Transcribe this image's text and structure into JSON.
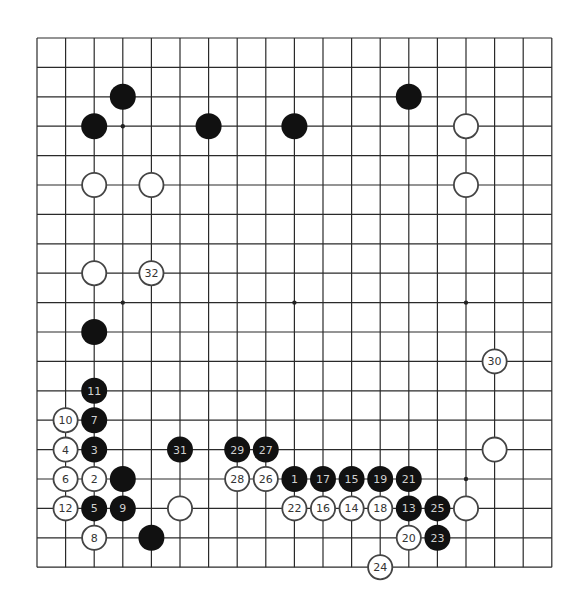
{
  "board": {
    "size": 19,
    "origin_x": 37,
    "origin_y": 38,
    "step_x": 28.6,
    "step_y": 29.4,
    "stone_radius": 13,
    "colors": {
      "line": "#2a2a2a",
      "black": "#111111",
      "white": "#ffffff",
      "white_outline": "#444444",
      "black_label": "#d0d0d0",
      "white_label": "#333333"
    },
    "star_points": [
      [
        3,
        3
      ],
      [
        9,
        3
      ],
      [
        15,
        3
      ],
      [
        3,
        9
      ],
      [
        9,
        9
      ],
      [
        15,
        9
      ],
      [
        3,
        15
      ],
      [
        9,
        15
      ],
      [
        15,
        15
      ]
    ],
    "stones": [
      {
        "color": "black",
        "col": 3,
        "row": 2,
        "label": ""
      },
      {
        "color": "black",
        "col": 2,
        "row": 3,
        "label": ""
      },
      {
        "color": "black",
        "col": 6,
        "row": 3,
        "label": ""
      },
      {
        "color": "black",
        "col": 9,
        "row": 3,
        "label": ""
      },
      {
        "color": "black",
        "col": 13,
        "row": 2,
        "label": ""
      },
      {
        "color": "white",
        "col": 15,
        "row": 3,
        "label": ""
      },
      {
        "color": "white",
        "col": 2,
        "row": 5,
        "label": ""
      },
      {
        "color": "white",
        "col": 4,
        "row": 5,
        "label": ""
      },
      {
        "color": "white",
        "col": 15,
        "row": 5,
        "label": ""
      },
      {
        "color": "white",
        "col": 2,
        "row": 8,
        "label": ""
      },
      {
        "color": "white",
        "col": 4,
        "row": 8,
        "label": "32"
      },
      {
        "color": "black",
        "col": 2,
        "row": 10,
        "label": ""
      },
      {
        "color": "white",
        "col": 16,
        "row": 11,
        "label": "30"
      },
      {
        "color": "black",
        "col": 2,
        "row": 12,
        "label": "11"
      },
      {
        "color": "white",
        "col": 1,
        "row": 13,
        "label": "10"
      },
      {
        "color": "black",
        "col": 2,
        "row": 13,
        "label": "7"
      },
      {
        "color": "white",
        "col": 1,
        "row": 14,
        "label": "4"
      },
      {
        "color": "black",
        "col": 2,
        "row": 14,
        "label": "3"
      },
      {
        "color": "black",
        "col": 5,
        "row": 14,
        "label": "31"
      },
      {
        "color": "black",
        "col": 7,
        "row": 14,
        "label": "29"
      },
      {
        "color": "black",
        "col": 8,
        "row": 14,
        "label": "27"
      },
      {
        "color": "white",
        "col": 16,
        "row": 14,
        "label": ""
      },
      {
        "color": "white",
        "col": 1,
        "row": 15,
        "label": "6"
      },
      {
        "color": "white",
        "col": 2,
        "row": 15,
        "label": "2"
      },
      {
        "color": "black",
        "col": 3,
        "row": 15,
        "label": ""
      },
      {
        "color": "white",
        "col": 7,
        "row": 15,
        "label": "28"
      },
      {
        "color": "white",
        "col": 8,
        "row": 15,
        "label": "26"
      },
      {
        "color": "black",
        "col": 9,
        "row": 15,
        "label": "1"
      },
      {
        "color": "black",
        "col": 10,
        "row": 15,
        "label": "17"
      },
      {
        "color": "black",
        "col": 11,
        "row": 15,
        "label": "15"
      },
      {
        "color": "black",
        "col": 12,
        "row": 15,
        "label": "19"
      },
      {
        "color": "black",
        "col": 13,
        "row": 15,
        "label": "21"
      },
      {
        "color": "white",
        "col": 1,
        "row": 16,
        "label": "12"
      },
      {
        "color": "black",
        "col": 2,
        "row": 16,
        "label": "5"
      },
      {
        "color": "black",
        "col": 3,
        "row": 16,
        "label": "9"
      },
      {
        "color": "white",
        "col": 5,
        "row": 16,
        "label": ""
      },
      {
        "color": "white",
        "col": 9,
        "row": 16,
        "label": "22"
      },
      {
        "color": "white",
        "col": 10,
        "row": 16,
        "label": "16"
      },
      {
        "color": "white",
        "col": 11,
        "row": 16,
        "label": "14"
      },
      {
        "color": "white",
        "col": 12,
        "row": 16,
        "label": "18"
      },
      {
        "color": "black",
        "col": 13,
        "row": 16,
        "label": "13"
      },
      {
        "color": "black",
        "col": 14,
        "row": 16,
        "label": "25"
      },
      {
        "color": "white",
        "col": 15,
        "row": 16,
        "label": ""
      },
      {
        "color": "white",
        "col": 2,
        "row": 17,
        "label": "8"
      },
      {
        "color": "black",
        "col": 4,
        "row": 17,
        "label": ""
      },
      {
        "color": "white",
        "col": 13,
        "row": 17,
        "label": "20"
      },
      {
        "color": "black",
        "col": 14,
        "row": 17,
        "label": "23"
      },
      {
        "color": "white",
        "col": 12,
        "row": 18,
        "label": "24"
      }
    ]
  }
}
